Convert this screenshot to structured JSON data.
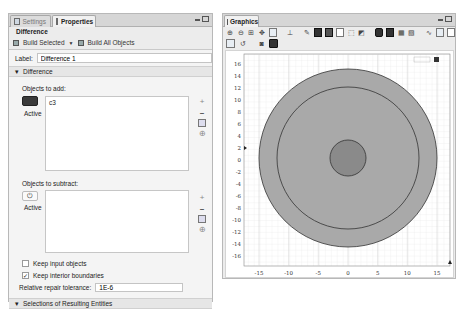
{
  "settings_panel": {
    "tabs": [
      {
        "label": "Settings",
        "icon": "settings-grid-icon",
        "active": false
      },
      {
        "label": "Properties",
        "icon": "properties-doc-icon",
        "active": true
      }
    ],
    "node_title": "Difference",
    "build_selected_label": "Build Selected",
    "build_all_label": "Build All Objects",
    "label_caption": "Label:",
    "label_value": "Difference 1",
    "section_difference": "Difference",
    "objects_to_add": {
      "caption": "Objects to add:",
      "toggle_label": "Active",
      "toggle_state": "on",
      "items": [
        "c3"
      ]
    },
    "objects_to_subtract": {
      "caption": "Objects to subtract:",
      "toggle_label": "Active",
      "toggle_state": "off",
      "items": []
    },
    "keep_input_objects": {
      "label": "Keep input objects",
      "checked": false,
      "mark": ""
    },
    "keep_interior_boundaries": {
      "label": "Keep interior boundaries",
      "checked": true,
      "mark": "✓"
    },
    "repair_tolerance": {
      "label": "Relative repair tolerance:",
      "value": "1E-6"
    },
    "section_selections": "Selections of Resulting Entities"
  },
  "graphics_panel": {
    "tab_label": "Graphics",
    "toolbar_row1": [
      "zoom-in",
      "zoom-out",
      "zoom-box",
      "zoom-extents",
      "pan",
      "axis-orientation",
      "select",
      "select-domain",
      "select-boundary",
      "select-point",
      "deselect",
      "scene-light",
      "transparency",
      "wireframe",
      "grid",
      "show-axis",
      "render",
      "view-all"
    ],
    "toolbar_row2": [
      "image-snapshot",
      "reset",
      "camera",
      "save"
    ],
    "plot": {
      "x_ticks": [
        "-15",
        "-10",
        "-5",
        "0",
        "5",
        "10",
        "15"
      ],
      "y_ticks": [
        "16",
        "14",
        "12",
        "10",
        "8",
        "6",
        "4",
        "2",
        "0",
        "-2",
        "-4",
        "-6",
        "-8",
        "-10",
        "-12",
        "-14",
        "-16"
      ],
      "outer_radius": 15,
      "middle_radius": 12,
      "inner_radius": 3,
      "outer_fill": "#a9a9a9",
      "inner_fill": "#8a8a8a",
      "stroke": "#333333"
    }
  }
}
